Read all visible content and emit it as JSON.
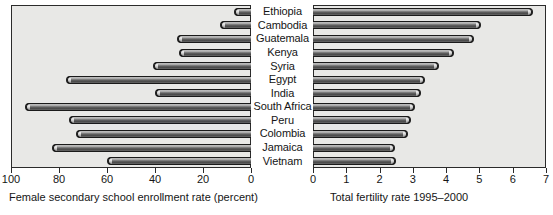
{
  "chart_data": {
    "type": "bar",
    "layout": "paired-horizontal-bar (back-to-back)",
    "categories": [
      "Ethiopia",
      "Cambodia",
      "Guatemala",
      "Kenya",
      "Syria",
      "Egypt",
      "India",
      "South Africa",
      "Peru",
      "Colombia",
      "Jamaica",
      "Vietnam"
    ],
    "panels": [
      {
        "id": "left",
        "xlabel": "Female secondary school enrollment rate (percent)",
        "xlim": [
          100,
          0
        ],
        "direction": "reversed",
        "ticks": [
          100,
          80,
          60,
          40,
          20,
          0
        ],
        "ticklabels": [
          "100",
          "80",
          "60",
          "40",
          "20",
          "0"
        ],
        "values": [
          7,
          13,
          31,
          30,
          41,
          77,
          40,
          94,
          76,
          73,
          83,
          60
        ],
        "grid": false
      },
      {
        "id": "right",
        "xlabel": "Total fertility rate 1995–2000",
        "xlim": [
          0,
          7
        ],
        "direction": "normal",
        "ticks": [
          0,
          1,
          2,
          3,
          4,
          5,
          6,
          7
        ],
        "ticklabels": [
          "0",
          "1",
          "2",
          "3",
          "4",
          "5",
          "6",
          "7"
        ],
        "values": [
          6.6,
          5.05,
          4.85,
          4.25,
          3.8,
          3.35,
          3.25,
          3.05,
          2.95,
          2.85,
          2.45,
          2.5
        ],
        "grid": false
      }
    ],
    "title": "",
    "colors": {
      "panel_background": "#e8e8e6",
      "bar_dark": "#4a4a4a",
      "bar_light": "#cfcfcf",
      "outline": "#1a1a1a",
      "text": "#151515",
      "page_background": "#ffffff"
    }
  }
}
